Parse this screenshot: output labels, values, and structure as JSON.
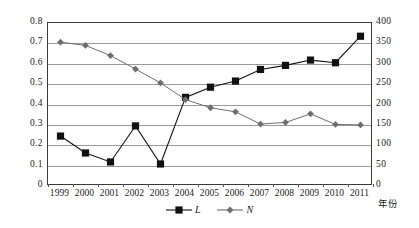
{
  "chart_data": {
    "type": "line",
    "title": "",
    "xlabel": "年份",
    "ylabel": "",
    "grid": true,
    "legend_position": "bottom-center",
    "categories": [
      "1999",
      "2000",
      "2001",
      "2002",
      "2003",
      "2004",
      "2005",
      "2006",
      "2007",
      "2008",
      "2009",
      "2010",
      "2011"
    ],
    "axes": {
      "left": {
        "ylim": [
          0,
          0.8
        ],
        "ticks": [
          "0",
          "0.1",
          "0.2",
          "0.3",
          "0.4",
          "0.5",
          "0.6",
          "0.7",
          "0.8"
        ],
        "tick_values": [
          0,
          0.1,
          0.2,
          0.3,
          0.4,
          0.5,
          0.6,
          0.7,
          0.8
        ],
        "series": "L"
      },
      "right": {
        "ylim": [
          0,
          400
        ],
        "ticks": [
          "0",
          "50",
          "100",
          "150",
          "200",
          "250",
          "300",
          "350",
          "400"
        ],
        "tick_values": [
          0,
          50,
          100,
          150,
          200,
          250,
          300,
          350,
          400
        ],
        "series": "N"
      }
    },
    "series": [
      {
        "name": "L",
        "axis": "left",
        "marker": "square",
        "color": "#111111",
        "values": [
          0.245,
          0.162,
          0.118,
          0.295,
          0.108,
          0.435,
          0.485,
          0.515,
          0.572,
          0.592,
          0.618,
          0.605,
          0.735
        ]
      },
      {
        "name": "N",
        "axis": "right",
        "marker": "diamond",
        "color": "#6e6e6e",
        "values": [
          353,
          345,
          320,
          287,
          253,
          212,
          192,
          182,
          152,
          156,
          177,
          151,
          150
        ]
      }
    ]
  },
  "legend": {
    "items": [
      {
        "label": "L",
        "marker": "square",
        "color": "#111111"
      },
      {
        "label": "N",
        "marker": "diamond",
        "color": "#6e6e6e"
      }
    ]
  },
  "colors": {
    "series_l": "#111111",
    "series_n": "#6e6e6e",
    "gridline": "#9a9a9a",
    "frame": "#3a3a3a",
    "background": "#ffffff",
    "text": "#1a1a1a"
  }
}
